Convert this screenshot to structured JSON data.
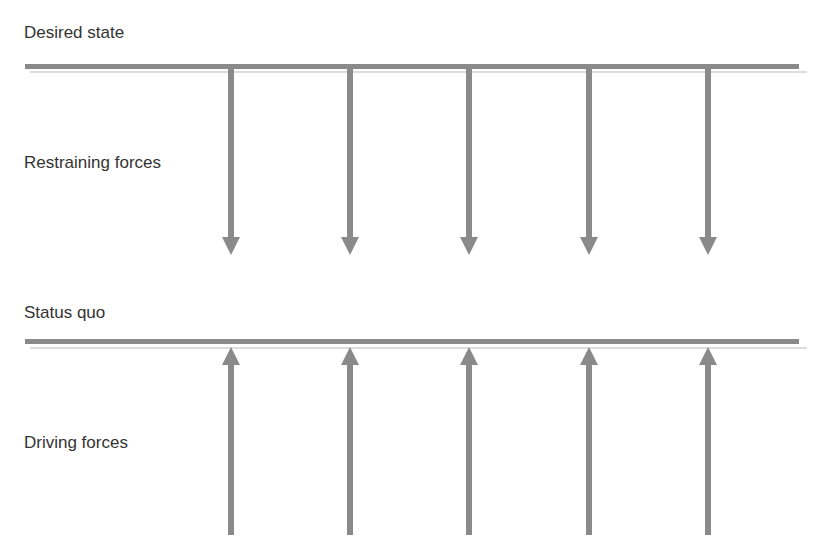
{
  "diagram": {
    "labels": {
      "desired_state": "Desired state",
      "restraining_forces": "Restraining forces",
      "status_quo": "Status quo",
      "driving_forces": "Driving forces"
    },
    "arrow_x": [
      231,
      350,
      469,
      589,
      708
    ],
    "colors": {
      "line": "#8a8a8a",
      "line_shadow": "#d6d6d6",
      "text": "#333333"
    }
  }
}
